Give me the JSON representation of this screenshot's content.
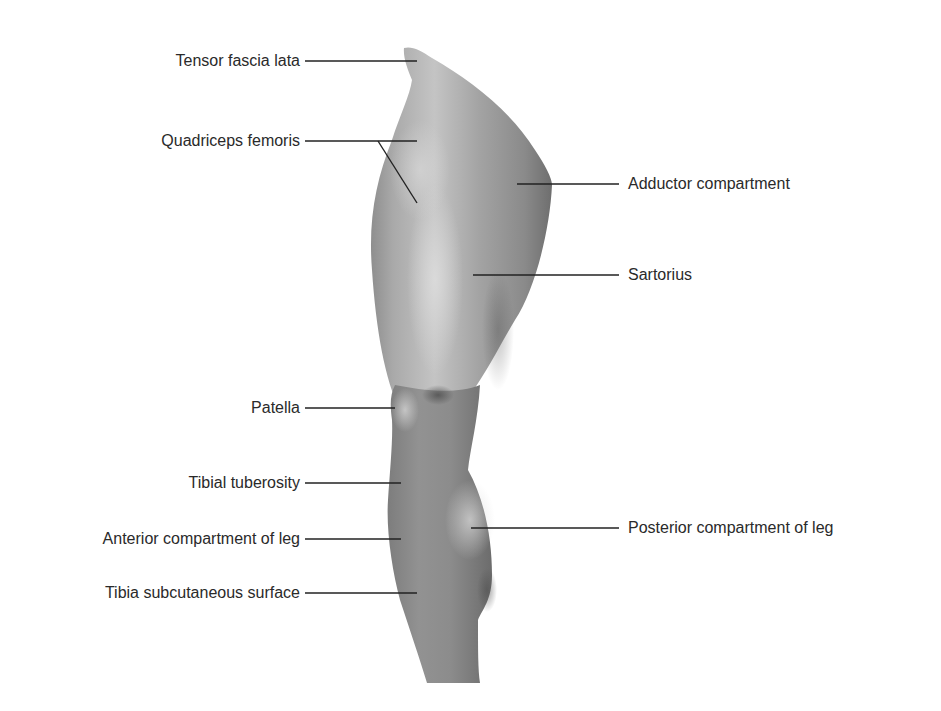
{
  "figure": {
    "background": "#ffffff",
    "line_color": "#222222",
    "text_color": "#2a2a2a"
  },
  "labels": {
    "left": [
      {
        "id": "tensor_fascia_lata",
        "text": "Tensor fascia lata"
      },
      {
        "id": "quadriceps_femoris",
        "text": "Quadriceps femoris"
      },
      {
        "id": "patella",
        "text": "Patella"
      },
      {
        "id": "tibial_tuberosity",
        "text": "Tibial tuberosity"
      },
      {
        "id": "anterior_compartment_of_leg",
        "text": "Anterior compartment of leg"
      },
      {
        "id": "tibia_subcutaneous_surface",
        "text": "Tibia subcutaneous surface"
      }
    ],
    "right": [
      {
        "id": "adductor_compartment",
        "text": "Adductor compartment"
      },
      {
        "id": "sartorius",
        "text": "Sartorius"
      },
      {
        "id": "posterior_compartment_of_leg",
        "text": "Posterior compartment of leg"
      }
    ]
  }
}
